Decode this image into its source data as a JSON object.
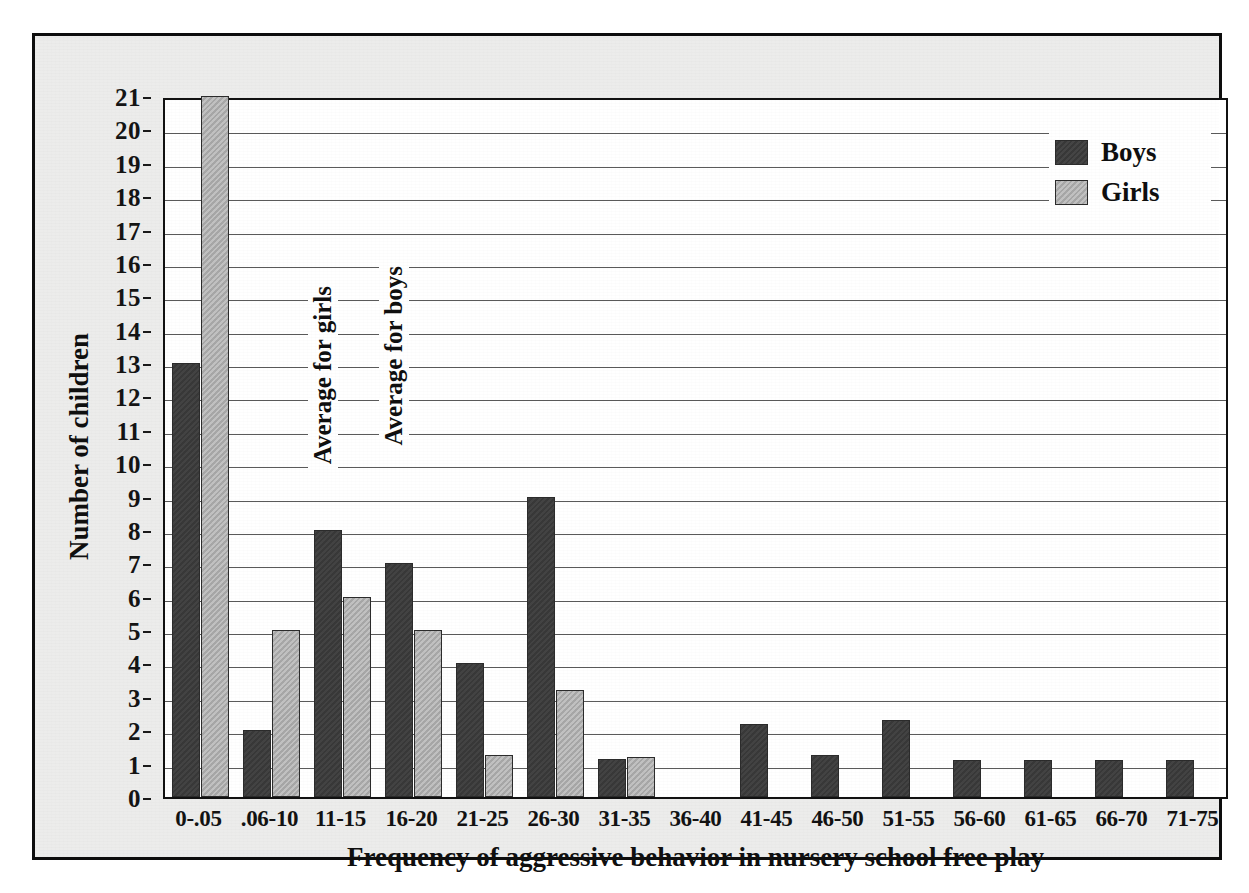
{
  "chart_data": {
    "type": "bar",
    "title": "",
    "xlabel": "Frequency of aggressive behavior in nursery school free play",
    "ylabel": "Number of children",
    "ylim": [
      0,
      21
    ],
    "ytick_step": 1,
    "grid": true,
    "legend_position": "top-right",
    "categories": [
      "0-.05",
      ".06-10",
      "11-15",
      "16-20",
      "21-25",
      "26-30",
      "31-35",
      "36-40",
      "41-45",
      "46-50",
      "51-55",
      "56-60",
      "61-65",
      "66-70",
      "71-75"
    ],
    "yticks": [
      "0",
      "1",
      "2",
      "3",
      "4",
      "5",
      "6",
      "7",
      "8",
      "9",
      "10",
      "11",
      "12",
      "13",
      "14",
      "15",
      "16",
      "17",
      "18",
      "19",
      "20",
      "21"
    ],
    "series": [
      {
        "name": "Boys",
        "color": "#3b3b3b",
        "values": [
          13,
          2,
          8,
          7,
          4,
          9,
          1.15,
          0,
          2.2,
          1.25,
          2.3,
          1.1,
          1.1,
          1.1,
          1.1
        ]
      },
      {
        "name": "Girls",
        "color": "#b0b0b0",
        "values": [
          21,
          5,
          6,
          5,
          1.25,
          3.2,
          1.2,
          0,
          0,
          0,
          0,
          0,
          0,
          0,
          0
        ]
      }
    ],
    "annotations": [
      {
        "text": "Average for girls",
        "category_index": 1,
        "rotation": -90
      },
      {
        "text": "Average for boys",
        "category_index": 2,
        "rotation": -90
      }
    ]
  },
  "legend": {
    "items": [
      {
        "label": "Boys",
        "swatch": "boys"
      },
      {
        "label": "Girls",
        "swatch": "girls"
      }
    ]
  }
}
